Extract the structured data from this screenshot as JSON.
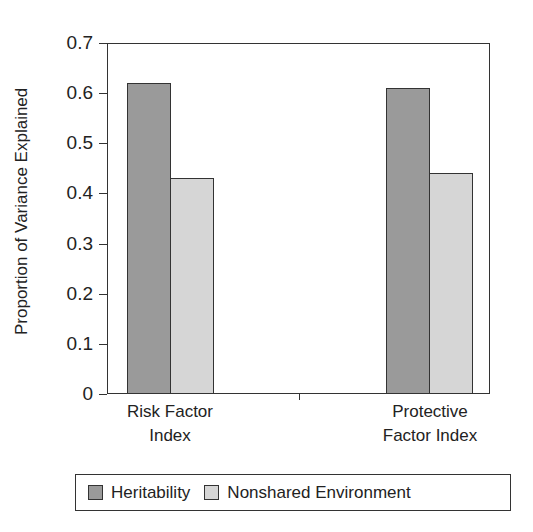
{
  "chart_data": {
    "type": "bar",
    "title": "",
    "xlabel": "",
    "ylabel": "Proportion of Variance Explained",
    "ylim": [
      0,
      0.7
    ],
    "yticks": [
      "0",
      "0.1",
      "0.2",
      "0.3",
      "0.4",
      "0.5",
      "0.6",
      "0.7"
    ],
    "categories": [
      "Risk Factor Index",
      "Protective Factor Index"
    ],
    "category_lines": [
      [
        "Risk Factor",
        "Index"
      ],
      [
        "Protective",
        "Factor Index"
      ]
    ],
    "series": [
      {
        "name": "Heritability",
        "color": "#9a9a9a",
        "values": [
          0.62,
          0.61
        ]
      },
      {
        "name": "Nonshared Environment",
        "color": "#d6d6d6",
        "values": [
          0.43,
          0.44
        ]
      }
    ],
    "grid": false,
    "legend_position": "bottom"
  }
}
